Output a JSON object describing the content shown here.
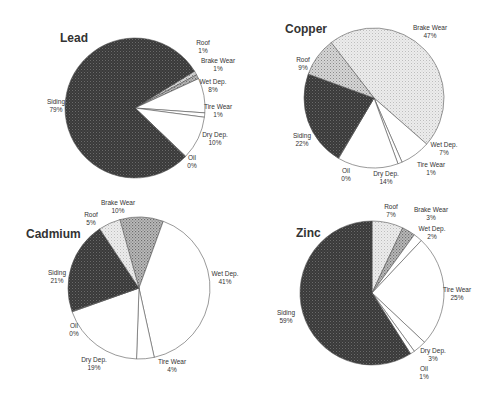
{
  "chart_data": [
    {
      "type": "pie",
      "title": "Lead",
      "center": [
        135,
        108
      ],
      "radius": 70,
      "start_deg": 58,
      "slices": [
        {
          "label": "Roof",
          "value": 1,
          "pct": "1%",
          "fill": "url(#dots)"
        },
        {
          "label": "Brake Wear",
          "value": 1,
          "pct": "1%",
          "fill": "url(#dots2)"
        },
        {
          "label": "Wet Dep.",
          "value": 8,
          "pct": "8%",
          "fill": "#ffffff"
        },
        {
          "label": "Tire Wear",
          "value": 1,
          "pct": "1%",
          "fill": "#ffffff"
        },
        {
          "label": "Dry Dep.",
          "value": 10,
          "pct": "10%",
          "fill": "#ffffff"
        },
        {
          "label": "Oil",
          "value": 0,
          "pct": "0%",
          "fill": "#ffffff"
        },
        {
          "label": "Siding",
          "value": 79,
          "pct": "79%",
          "fill": "url(#dark)"
        }
      ],
      "labels": [
        {
          "t": "Roof",
          "p": "1%",
          "x": 203,
          "y": 45
        },
        {
          "t": "Brake Wear",
          "p": "1%",
          "x": 218,
          "y": 63
        },
        {
          "t": "Wet Dep.",
          "p": "8%",
          "x": 213,
          "y": 84
        },
        {
          "t": "Tire Wear",
          "p": "1%",
          "x": 218,
          "y": 109
        },
        {
          "t": "Dry Dep.",
          "p": "10%",
          "x": 215,
          "y": 137
        },
        {
          "t": "Oil",
          "p": "0%",
          "x": 192,
          "y": 160
        },
        {
          "t": "Siding",
          "p": "79%",
          "x": 56,
          "y": 104
        }
      ]
    },
    {
      "type": "pie",
      "title": "Copper",
      "center": [
        374,
        98
      ],
      "radius": 70,
      "start_deg": 322,
      "slices": [
        {
          "label": "Brake Wear",
          "value": 47,
          "pct": "47%",
          "fill": "url(#light)"
        },
        {
          "label": "Wet Dep.",
          "value": 7,
          "pct": "7%",
          "fill": "#ffffff"
        },
        {
          "label": "Tire Wear",
          "value": 1,
          "pct": "1%",
          "fill": "#ffffff"
        },
        {
          "label": "Dry Dep.",
          "value": 14,
          "pct": "14%",
          "fill": "#ffffff"
        },
        {
          "label": "Oil",
          "value": 0,
          "pct": "0%",
          "fill": "#ffffff"
        },
        {
          "label": "Siding",
          "value": 22,
          "pct": "22%",
          "fill": "url(#dark)"
        },
        {
          "label": "Roof",
          "value": 9,
          "pct": "9%",
          "fill": "url(#dots)"
        }
      ],
      "labels": [
        {
          "t": "Brake Wear",
          "p": "47%",
          "x": 430,
          "y": 30
        },
        {
          "t": "Roof",
          "p": "9%",
          "x": 303,
          "y": 62
        },
        {
          "t": "Siding",
          "p": "22%",
          "x": 302,
          "y": 138
        },
        {
          "t": "Wet Dep.",
          "p": "7%",
          "x": 444,
          "y": 147
        },
        {
          "t": "Tire Wear",
          "p": "1%",
          "x": 431,
          "y": 167
        },
        {
          "t": "Oil",
          "p": "0%",
          "x": 346,
          "y": 173
        },
        {
          "t": "Dry Dep.",
          "p": "14%",
          "x": 386,
          "y": 176
        }
      ]
    },
    {
      "type": "pie",
      "title": "Cadmium",
      "center": [
        139,
        288
      ],
      "radius": 71,
      "start_deg": 344,
      "slices": [
        {
          "label": "Brake Wear",
          "value": 10,
          "pct": "10%",
          "fill": "url(#dots2)"
        },
        {
          "label": "Wet Dep.",
          "value": 41,
          "pct": "41%",
          "fill": "#ffffff"
        },
        {
          "label": "Tire Wear",
          "value": 4,
          "pct": "4%",
          "fill": "#ffffff"
        },
        {
          "label": "Dry Dep.",
          "value": 19,
          "pct": "19%",
          "fill": "#ffffff"
        },
        {
          "label": "Oil",
          "value": 0,
          "pct": "0%",
          "fill": "#ffffff"
        },
        {
          "label": "Siding",
          "value": 21,
          "pct": "21%",
          "fill": "url(#dark)"
        },
        {
          "label": "Roof",
          "value": 5,
          "pct": "5%",
          "fill": "url(#light)"
        }
      ],
      "labels": [
        {
          "t": "Brake Wear",
          "p": "10%",
          "x": 118,
          "y": 205
        },
        {
          "t": "Roof",
          "p": "5%",
          "x": 91,
          "y": 217
        },
        {
          "t": "Siding",
          "p": "21%",
          "x": 57,
          "y": 275
        },
        {
          "t": "Wet Dep.",
          "p": "41%",
          "x": 225,
          "y": 276
        },
        {
          "t": "Oil",
          "p": "0%",
          "x": 74,
          "y": 328
        },
        {
          "t": "Dry Dep.",
          "p": "19%",
          "x": 94,
          "y": 362
        },
        {
          "t": "Tire Wear",
          "p": "4%",
          "x": 172,
          "y": 364
        }
      ]
    },
    {
      "type": "pie",
      "title": "Zinc",
      "center": [
        372,
        293
      ],
      "radius": 72,
      "start_deg": 0,
      "slices": [
        {
          "label": "Roof",
          "value": 7,
          "pct": "7%",
          "fill": "url(#light)"
        },
        {
          "label": "Brake Wear",
          "value": 3,
          "pct": "3%",
          "fill": "url(#dots2)"
        },
        {
          "label": "Wet Dep.",
          "value": 2,
          "pct": "2%",
          "fill": "#ffffff"
        },
        {
          "label": "Tire Wear",
          "value": 25,
          "pct": "25%",
          "fill": "#ffffff"
        },
        {
          "label": "Dry Dep.",
          "value": 3,
          "pct": "3%",
          "fill": "#ffffff"
        },
        {
          "label": "Oil",
          "value": 1,
          "pct": "1%",
          "fill": "#ffffff"
        },
        {
          "label": "Siding",
          "value": 59,
          "pct": "59%",
          "fill": "url(#dark)"
        }
      ],
      "labels": [
        {
          "t": "Roof",
          "p": "7%",
          "x": 391,
          "y": 209
        },
        {
          "t": "Brake Wear",
          "p": "3%",
          "x": 431,
          "y": 212
        },
        {
          "t": "Wet Dep.",
          "p": "2%",
          "x": 432,
          "y": 231
        },
        {
          "t": "Tire Wear",
          "p": "25%",
          "x": 457,
          "y": 292
        },
        {
          "t": "Siding",
          "p": "59%",
          "x": 286,
          "y": 315
        },
        {
          "t": "Dry Dep.",
          "p": "3%",
          "x": 433,
          "y": 353
        },
        {
          "t": "Oil",
          "p": "1%",
          "x": 424,
          "y": 371
        }
      ]
    }
  ],
  "titles": {
    "lead": {
      "text": "Lead",
      "x": 60,
      "y": 42
    },
    "copper": {
      "text": "Copper",
      "x": 285,
      "y": 33
    },
    "cadmium": {
      "text": "Cadmium",
      "x": 26,
      "y": 238
    },
    "zinc": {
      "text": "Zinc",
      "x": 296,
      "y": 237
    }
  }
}
